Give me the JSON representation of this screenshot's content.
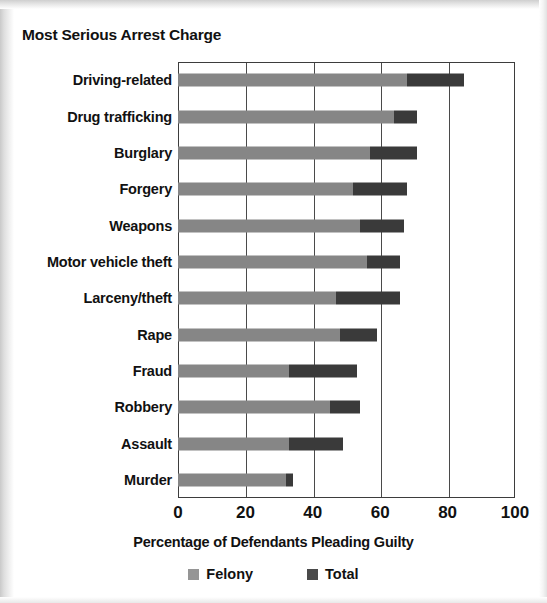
{
  "chart_data": {
    "type": "bar",
    "orientation": "horizontal",
    "title": "Most Serious Arrest Charge",
    "xlabel": "Percentage of Defendants Pleading Guilty",
    "ylabel": "",
    "xlim": [
      0,
      100
    ],
    "xticks": [
      0,
      20,
      40,
      60,
      80,
      100
    ],
    "xtick_labels": [
      "0",
      "20",
      "40",
      "60",
      "80",
      "100"
    ],
    "grid": "vertical",
    "legend_position": "bottom",
    "stacked": true,
    "categories": [
      "Driving-related",
      "Drug trafficking",
      "Burglary",
      "Forgery",
      "Weapons",
      "Motor vehicle theft",
      "Larceny/theft",
      "Rape",
      "Fraud",
      "Robbery",
      "Assault",
      "Murder"
    ],
    "series": [
      {
        "name": "Felony",
        "color": "#868686",
        "values": [
          68,
          64,
          57,
          52,
          54,
          56,
          47,
          48,
          33,
          45,
          33,
          32
        ]
      },
      {
        "name": "Total",
        "color": "#3a3a3a",
        "values": [
          85,
          71,
          71,
          68,
          67,
          66,
          66,
          59,
          53,
          54,
          49,
          34
        ]
      }
    ],
    "legend": [
      {
        "label": "Felony",
        "swatch": "felony"
      },
      {
        "label": "Total",
        "swatch": "total"
      }
    ]
  },
  "colors": {
    "felony": "#868686",
    "total": "#3a3a3a",
    "axis": "#3d3d3d",
    "text": "#111111",
    "background": "#ffffff"
  }
}
